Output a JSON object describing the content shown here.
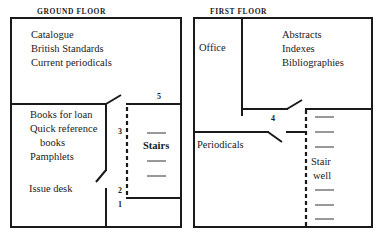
{
  "ground_floor": {
    "title": "GROUND FLOOR",
    "rooms": {
      "upper": [
        "Catalogue",
        "British Standards",
        "Current periodicals"
      ],
      "lower_left": [
        "Books for loan",
        "Quick reference",
        "books",
        "Pamphlets"
      ],
      "issue_desk": "Issue desk",
      "stairs": "Stairs"
    },
    "markers": [
      "5",
      "3",
      "2",
      "1"
    ]
  },
  "first_floor": {
    "title": "FIRST FLOOR",
    "rooms": {
      "office": "Office",
      "upper": [
        "Abstracts",
        "Indexes",
        "Bibliographies"
      ],
      "periodicals": "Periodicals",
      "stairwell": [
        "Stair",
        "well"
      ]
    },
    "markers": [
      "4"
    ]
  },
  "colors": {
    "ink": "#1a1a1a",
    "background": "#ffffff"
  }
}
